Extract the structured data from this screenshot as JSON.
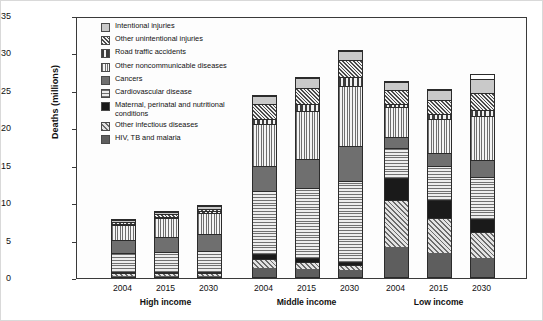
{
  "chart_data": {
    "type": "bar",
    "subtype": "stacked-grouped",
    "title": "",
    "xlabel": "",
    "ylabel": "Deaths (millions)",
    "ylim": [
      0,
      35
    ],
    "yticks": [
      0,
      5,
      10,
      15,
      20,
      25,
      30,
      35
    ],
    "grid": false,
    "legend_position": "top-left-inside",
    "groups": [
      "High income",
      "Middle income",
      "Low income"
    ],
    "categories": [
      "2004",
      "2015",
      "2030"
    ],
    "series": [
      {
        "name": "HIV, TB and malaria",
        "pattern": "solid-dark-gray",
        "values": {
          "High income": [
            0.08,
            0.08,
            0.08
          ],
          "Middle income": [
            1.2,
            1.1,
            0.9
          ],
          "Low income": [
            4.0,
            3.3,
            2.6
          ]
        }
      },
      {
        "name": "Other infectious diseases",
        "pattern": "light-diagonal-hatch",
        "values": {
          "High income": [
            0.45,
            0.45,
            0.45
          ],
          "Middle income": [
            1.2,
            0.9,
            0.7
          ],
          "Low income": [
            6.4,
            4.7,
            3.4
          ]
        }
      },
      {
        "name": "Maternal, perinatal and nutritional conditions",
        "pattern": "solid-black",
        "values": {
          "High income": [
            0.12,
            0.12,
            0.12
          ],
          "Middle income": [
            0.75,
            0.55,
            0.4
          ],
          "Low income": [
            3.0,
            2.4,
            1.7
          ]
        }
      },
      {
        "name": "Cardiovascular disease",
        "pattern": "horizontal-lines",
        "values": {
          "High income": [
            2.6,
            2.8,
            3.0
          ],
          "Middle income": [
            8.5,
            9.5,
            10.9
          ],
          "Low income": [
            4.0,
            4.6,
            5.6
          ]
        }
      },
      {
        "name": "Cancers",
        "pattern": "solid-mid-gray",
        "values": {
          "High income": [
            1.9,
            2.1,
            2.3
          ],
          "Middle income": [
            3.4,
            3.9,
            4.8
          ],
          "Low income": [
            1.5,
            1.8,
            2.3
          ]
        }
      },
      {
        "name": "Other noncommunicable diseases",
        "pattern": "vertical-thin-lines",
        "values": {
          "High income": [
            2.0,
            2.6,
            3.0
          ],
          "Middle income": [
            5.6,
            6.5,
            8.0
          ],
          "Low income": [
            4.0,
            4.6,
            5.9
          ]
        }
      },
      {
        "name": "Road traffic accidents",
        "pattern": "vertical-thick-bars",
        "values": {
          "High income": [
            0.14,
            0.14,
            0.14
          ],
          "Middle income": [
            0.75,
            0.95,
            1.2
          ],
          "Low income": [
            0.5,
            0.6,
            0.8
          ]
        }
      },
      {
        "name": "Other unintentional injuries",
        "pattern": "dense-diagonal-hatch",
        "values": {
          "High income": [
            0.35,
            0.4,
            0.4
          ],
          "Middle income": [
            1.9,
            2.1,
            2.3
          ],
          "Low income": [
            1.8,
            1.9,
            2.3
          ]
        }
      },
      {
        "name": "Intentional injuries",
        "pattern": "solid-light-gray",
        "values": {
          "High income": [
            0.26,
            0.3,
            0.3
          ],
          "Middle income": [
            1.2,
            1.3,
            1.2
          ],
          "Low income": [
            1.1,
            1.4,
            1.8
          ]
        }
      }
    ],
    "totals": {
      "High income": [
        7.9,
        9.0,
        9.7
      ],
      "Middle income": [
        24.5,
        26.8,
        30.4
      ],
      "Low income": [
        26.3,
        25.3,
        27.3
      ]
    }
  },
  "axis": {
    "y_label": "Deaths (millions)",
    "y_ticks": [
      "0",
      "5",
      "10",
      "15",
      "20",
      "25",
      "30",
      "35"
    ]
  },
  "legend": {
    "items": [
      {
        "label": "Intentional injuries",
        "swatch": "solid-light-gray"
      },
      {
        "label": "Other unintentional injuries",
        "swatch": "dense-diagonal-hatch"
      },
      {
        "label": "Road traffic accidents",
        "swatch": "vertical-thick-bars"
      },
      {
        "label": "Other noncommunicable diseases",
        "swatch": "vertical-thin-lines"
      },
      {
        "label": "Cancers",
        "swatch": "solid-mid-gray"
      },
      {
        "label": "Cardiovascular disease",
        "swatch": "horizontal-lines"
      },
      {
        "label": "Maternal, perinatal and nutritional conditions",
        "swatch": "solid-black"
      },
      {
        "label": "Other infectious diseases",
        "swatch": "light-diagonal-hatch"
      },
      {
        "label": "HIV, TB and malaria",
        "swatch": "solid-dark-gray"
      }
    ]
  },
  "xaxis": {
    "groups": [
      {
        "label": "High income",
        "ticks": [
          "2004",
          "2015",
          "2030"
        ]
      },
      {
        "label": "Middle income",
        "ticks": [
          "2004",
          "2015",
          "2030"
        ]
      },
      {
        "label": "Low income",
        "ticks": [
          "2004",
          "2015",
          "2030"
        ]
      }
    ]
  }
}
